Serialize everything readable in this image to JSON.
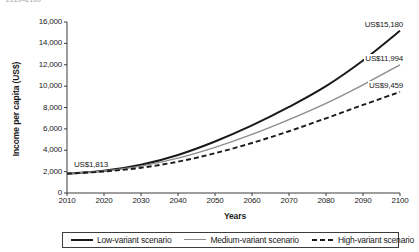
{
  "top_caption": "2010–2100",
  "chart_data": {
    "type": "line",
    "title": "",
    "xlabel": "Years",
    "ylabel": "Income per capita (US$)",
    "xlim": [
      2010,
      2100
    ],
    "ylim": [
      0,
      16000
    ],
    "grid": false,
    "legend_position": "bottom",
    "x": [
      2010,
      2020,
      2030,
      2040,
      2050,
      2060,
      2070,
      2080,
      2090,
      2100
    ],
    "xticklabels": [
      "2010",
      "2020",
      "2030",
      "2040",
      "2050",
      "2060",
      "2070",
      "2080",
      "2090",
      "2100"
    ],
    "yticks": [
      0,
      2000,
      4000,
      6000,
      8000,
      10000,
      12000,
      14000,
      16000
    ],
    "yticklabels": [
      "0",
      "2,000",
      "4,000",
      "6,000",
      "8,000",
      "10,000",
      "12,000",
      "14,000",
      "16,000"
    ],
    "series": [
      {
        "name": "Low-variant scenario",
        "style": "solid-thick",
        "color": "#1a1a1a",
        "values": [
          1813,
          2090,
          2640,
          3560,
          4820,
          6320,
          8050,
          10000,
          12400,
          15180
        ],
        "end_label": "US$15,180"
      },
      {
        "name": "Medium-variant scenario",
        "style": "solid-thin",
        "color": "#8d8d8d",
        "values": [
          1813,
          2060,
          2520,
          3260,
          4270,
          5480,
          6860,
          8380,
          10120,
          11994
        ],
        "end_label": "US$11,994"
      },
      {
        "name": "High-variant scenario",
        "style": "dashed",
        "color": "#1a1a1a",
        "values": [
          1813,
          2010,
          2360,
          2930,
          3720,
          4680,
          5780,
          6990,
          8240,
          9459
        ],
        "end_label": "US$9,459"
      }
    ],
    "annotations": [
      {
        "text": "US$1,813",
        "x": 2010,
        "y": 1813,
        "placement": "start"
      },
      {
        "text": "US$15,180",
        "x": 2100,
        "y": 15180,
        "placement": "end-low"
      },
      {
        "text": "US$11,994",
        "x": 2100,
        "y": 11994,
        "placement": "end-medium"
      },
      {
        "text": "US$9,459",
        "x": 2100,
        "y": 9459,
        "placement": "end-high"
      }
    ]
  },
  "legend": {
    "items": [
      {
        "label": "Low-variant scenario",
        "swatch": "solid-thick-line-icon"
      },
      {
        "label": "Medium-variant scenario",
        "swatch": "solid-thin-line-icon"
      },
      {
        "label": "High-variant scenario",
        "swatch": "dashed-line-icon"
      }
    ]
  }
}
